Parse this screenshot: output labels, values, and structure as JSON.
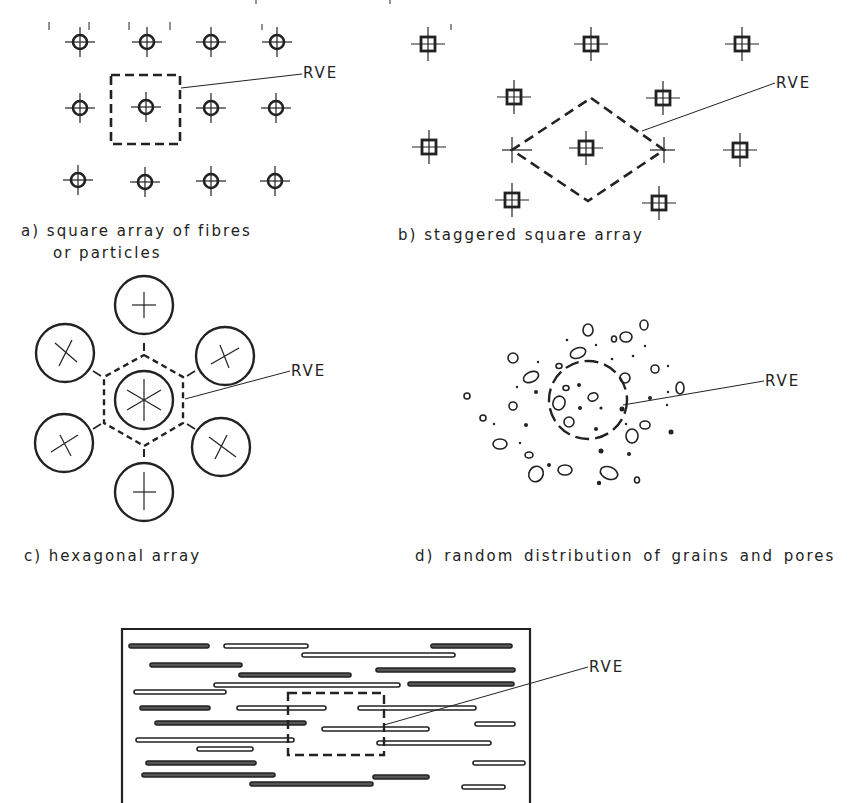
{
  "figure": {
    "panels": [
      {
        "id": "a",
        "caption_line1": "a)  square array of fibres",
        "caption_line2": "or particles",
        "rve_label": "RVE"
      },
      {
        "id": "b",
        "caption": "b)  staggered square array",
        "rve_label": "RVE"
      },
      {
        "id": "c",
        "caption": "c)  hexagonal array",
        "rve_label": "RVE"
      },
      {
        "id": "d",
        "caption": "d)  random distribution of grains  and pores",
        "rve_label": "RVE"
      },
      {
        "id": "e",
        "rve_label": "RVE"
      }
    ],
    "colors": {
      "ink": "#222222",
      "background": "#ffffff"
    }
  }
}
